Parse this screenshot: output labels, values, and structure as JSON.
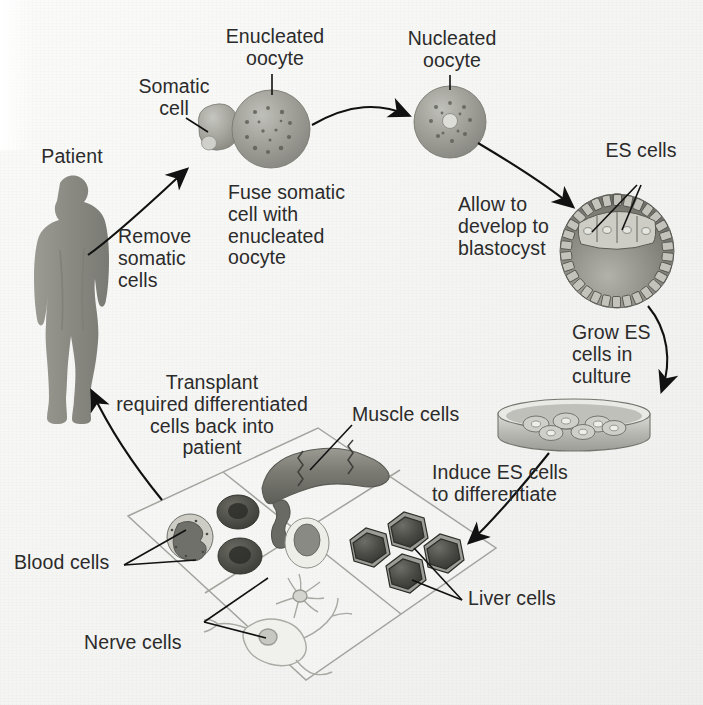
{
  "figure": {
    "type": "process-cycle-diagram",
    "background_color": "#f4f4f2",
    "text_color": "#2b2b2b",
    "line_color": "#1a1a1a"
  },
  "labels": {
    "patient": "Patient",
    "somatic_cell": "Somatic\ncell",
    "enucleated_oocyte": "Enucleated\noocyte",
    "nucleated_oocyte": "Nucleated\noocyte",
    "es_cells": "ES cells",
    "muscle_cells": "Muscle cells",
    "blood_cells": "Blood cells",
    "nerve_cells": "Nerve cells",
    "liver_cells": "Liver cells"
  },
  "steps": {
    "remove": "Remove\nsomatic\ncells",
    "fuse": "Fuse somatic\ncell with\nenucleated\noocyte",
    "develop": "Allow to\ndevelop to\nblastocyst",
    "grow": "Grow ES\ncells in\nculture",
    "induce": "Induce ES cells\nto differentiate",
    "transplant": "Transplant\nrequired differentiated\ncells back into\npatient"
  },
  "objects": {
    "patient_figure": "human-silhouette",
    "somatic_cell_shape": "small-rounded-cell-with-nucleus",
    "enucleated_oocyte_shape": "large-sphere-speckled-no-nucleus",
    "nucleated_oocyte_shape": "sphere-with-central-nucleus",
    "blastocyst_shape": "sphere-with-trophoblast-ring-and-inner-cell-mass",
    "petri_dish_shape": "culture-dish-with-colonies",
    "panel_grid": "tilted-2x2-grid",
    "muscle_shape": "curved-striated-muscle-fiber",
    "blood_shape": "leukocyte-erythrocytes-platelet",
    "nerve_shape": "branched-neurons",
    "liver_shape": "four-hexagonal-hepatocytes"
  },
  "colors": {
    "silhouette": "#8c8c86",
    "oocyte_fill": "#9a9a94",
    "blastocyst_fill": "#8a8a84",
    "muscle_fill": "#7e7e78",
    "liver_fill": "#4a4a46",
    "panel_stroke": "#9a9a96"
  }
}
